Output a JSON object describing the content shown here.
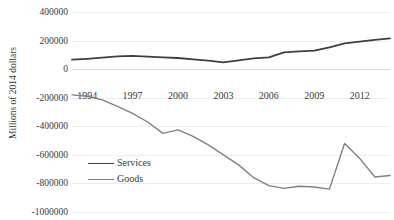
{
  "figure": {
    "title_remnant": "",
    "ylabel": "Millions of 2014 dollars"
  },
  "colors": {
    "services": "#3f3f3f",
    "goods": "#808080",
    "grid": "#ededed",
    "zero_axis": "#d9d9d9",
    "text": "#3a3a3a",
    "background": "#ffffff"
  },
  "legend": {
    "position": "inside-lower-left",
    "items": [
      {
        "label": "Services",
        "color": "#3f3f3f"
      },
      {
        "label": "Goods",
        "color": "#808080"
      }
    ]
  },
  "axes": {
    "y_ticks": [
      "400000",
      "200000",
      "0",
      "-200000",
      "-400000",
      "-600000",
      "-800000",
      "-1000000"
    ],
    "y_tick_values": [
      400000,
      200000,
      0,
      -200000,
      -400000,
      -600000,
      -800000,
      -1000000
    ],
    "x_ticks": [
      "1994",
      "1997",
      "2000",
      "2003",
      "2006",
      "2009",
      "2012"
    ],
    "x_tick_values": [
      1994,
      1997,
      2000,
      2003,
      2006,
      2009,
      2012
    ]
  },
  "chart_data": {
    "type": "line",
    "title": "",
    "xlabel": "",
    "ylabel": "Millions of 2014 dollars",
    "ylim": [
      -1000000,
      400000
    ],
    "xlim": [
      1993,
      2014
    ],
    "grid": true,
    "legend_position": "inside-lower-left",
    "x": [
      1993,
      1994,
      1995,
      1996,
      1997,
      1998,
      1999,
      2000,
      2001,
      2002,
      2003,
      2004,
      2005,
      2006,
      2007,
      2008,
      2009,
      2010,
      2011,
      2012,
      2013,
      2014
    ],
    "series": [
      {
        "name": "Services",
        "color": "#3f3f3f",
        "values": [
          66000,
          72000,
          80000,
          90000,
          93000,
          88000,
          82000,
          78000,
          68000,
          60000,
          47000,
          62000,
          75000,
          82000,
          118000,
          124000,
          130000,
          152000,
          180000,
          193000,
          205000,
          215000
        ]
      },
      {
        "name": "Goods",
        "color": "#808080",
        "values": [
          -180000,
          -190000,
          -215000,
          -260000,
          -310000,
          -370000,
          -450000,
          -425000,
          -470000,
          -530000,
          -600000,
          -670000,
          -760000,
          -815000,
          -835000,
          -820000,
          -825000,
          -840000,
          -520000,
          -625000,
          -755000,
          -745000
        ]
      }
    ]
  }
}
